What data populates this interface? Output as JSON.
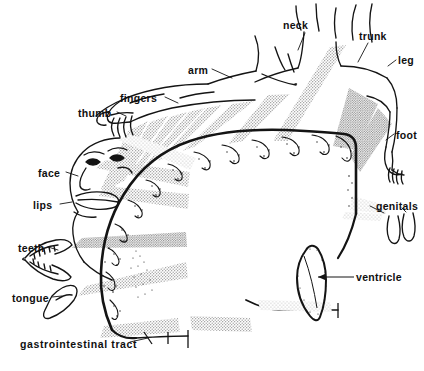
{
  "figure": {
    "kind": "anatomical-diagram",
    "background_color": "#ffffff",
    "ink_color": "#111111",
    "stipple_color": "#9a9a9a",
    "width": 424,
    "height": 371
  },
  "labels": [
    {
      "id": "neck",
      "text": "neck",
      "x": 283,
      "y": 20,
      "anchor": "start"
    },
    {
      "id": "trunk",
      "text": "trunk",
      "x": 359,
      "y": 31,
      "anchor": "start"
    },
    {
      "id": "leg",
      "text": "leg",
      "x": 398,
      "y": 55,
      "anchor": "start"
    },
    {
      "id": "arm",
      "text": "arm",
      "x": 188,
      "y": 65,
      "anchor": "start"
    },
    {
      "id": "fingers",
      "text": "fingers",
      "x": 120,
      "y": 93,
      "anchor": "start"
    },
    {
      "id": "thumb",
      "text": "thumb",
      "x": 78,
      "y": 108,
      "anchor": "start"
    },
    {
      "id": "foot",
      "text": "foot",
      "x": 396,
      "y": 130,
      "anchor": "start"
    },
    {
      "id": "face",
      "text": "face",
      "x": 38,
      "y": 168,
      "anchor": "start"
    },
    {
      "id": "lips",
      "text": "lips",
      "x": 33,
      "y": 200,
      "anchor": "start"
    },
    {
      "id": "genitals",
      "text": "genitals",
      "x": 376,
      "y": 201,
      "anchor": "start"
    },
    {
      "id": "teeth",
      "text": "teeth",
      "x": 18,
      "y": 243,
      "anchor": "start"
    },
    {
      "id": "ventricle",
      "text": "ventricle",
      "x": 356,
      "y": 275,
      "anchor": "start"
    },
    {
      "id": "tongue",
      "text": "tongue",
      "x": 12,
      "y": 293,
      "anchor": "start"
    },
    {
      "id": "gi-tract",
      "text": "gastrointestinal  tract",
      "x": 20,
      "y": 339,
      "anchor": "start"
    }
  ],
  "body_parts": [
    "neck",
    "trunk",
    "leg",
    "arm",
    "fingers",
    "thumb",
    "foot",
    "face",
    "lips",
    "genitals",
    "teeth",
    "tongue",
    "ventricle",
    "gastrointestinal tract"
  ],
  "structures": {
    "cortex_band": "arched cortical strip with scalloped gyri along its outer edge",
    "ventricle_outline": "teardrop shaped ventricle outline right of centre",
    "human_figure": "reclining body: head at left, arm extended, torso, leg and foot at right",
    "inset_teeth": "open jaw with teeth, lower left",
    "inset_tongue": "tongue shape, lower left",
    "inset_genitals": "forked genital outline, right"
  }
}
